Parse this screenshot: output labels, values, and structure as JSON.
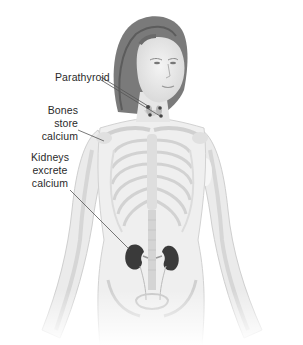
{
  "figure": {
    "colors": {
      "background": "#ffffff",
      "skin": "#ececec",
      "bone": "#dcdcdc",
      "hair": "#6e6e6e",
      "kidney": "#3a3a3a",
      "parathyroid": "#444444",
      "leader_line": "#555555",
      "label_text": "#2a2a2a"
    },
    "labels": [
      {
        "id": "parathyroid",
        "lines": [
          "Parathyroid"
        ],
        "target": "parathyroid glands in neck"
      },
      {
        "id": "bones",
        "lines": [
          "Bones store",
          "calcium"
        ],
        "target": "shoulder / clavicle bone"
      },
      {
        "id": "kidneys",
        "lines": [
          "Kidneys",
          "excrete",
          "calcium"
        ],
        "target": "left kidney"
      }
    ]
  }
}
